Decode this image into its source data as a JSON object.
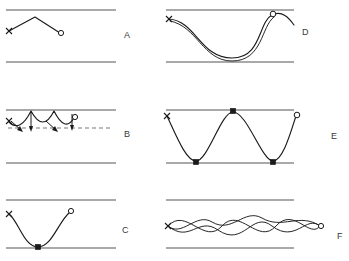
{
  "figure": {
    "title": "",
    "width": 349,
    "height": 261,
    "background_color": "#ffffff",
    "line_color": "#1a1a1a",
    "boundary_color": "#555555",
    "label_color": "#3a3a3a"
  },
  "panels": [
    {
      "id": "A",
      "label": "A",
      "label_x": 124,
      "label_y": 38,
      "description": "triangular peak trajectory between two horizontal walls",
      "top_wall_y": 10,
      "bottom_wall_y": 62,
      "wall_x1": 6,
      "wall_x2": 116,
      "start_marker": "x",
      "end_marker": "circle",
      "start_point": [
        9,
        31
      ],
      "end_point": [
        60,
        33
      ],
      "apex_point": [
        35,
        17
      ],
      "path": "M 9 31 L 35 17 L 60 33",
      "markers": []
    },
    {
      "id": "B",
      "label": "B",
      "label_x": 124,
      "label_y": 137,
      "description": "scalloped arcs hanging below upper wall with downward arrows and a dashed reference line",
      "top_wall_y": 110,
      "bottom_wall_y": 163,
      "wall_x1": 6,
      "wall_x2": 116,
      "dashed_line_y": 128,
      "dashed_x1": 8,
      "dashed_x2": 112,
      "start_marker": "x",
      "end_marker": "circle",
      "start_point": [
        9,
        122
      ],
      "end_point": [
        74,
        118
      ],
      "arc_count": 3,
      "path": "M 9 122 Q 20 133 31 111 Q 43 133 54 111 Q 65 133 74 118",
      "arrows": [
        {
          "x1": 11,
          "y1": 122,
          "x2": 24,
          "y2": 133,
          "direction": "down-right"
        },
        {
          "x1": 31,
          "y1": 113,
          "x2": 31,
          "y2": 131,
          "direction": "down"
        },
        {
          "x1": 46,
          "y1": 120,
          "x2": 58,
          "y2": 132,
          "direction": "down-right"
        },
        {
          "x1": 72,
          "y1": 114,
          "x2": 72,
          "y2": 130,
          "direction": "down"
        }
      ]
    },
    {
      "id": "C",
      "label": "C",
      "label_x": 122,
      "label_y": 233,
      "description": "smooth U-shaped curve descending to touch the lower wall then rising",
      "top_wall_y": 200,
      "bottom_wall_y": 248,
      "wall_x1": 6,
      "wall_x2": 116,
      "start_marker": "x",
      "end_marker": "circle",
      "start_point": [
        9,
        214
      ],
      "end_point": [
        70,
        212
      ],
      "contact_point": [
        38,
        247
      ],
      "contact_marker": "square",
      "path": "M 9 214 C 19 222 24 247 38 247 C 52 247 58 222 70 212"
    },
    {
      "id": "D",
      "label": "D",
      "label_x": 302,
      "label_y": 35,
      "description": "two near-parallel deep U-shaped curves with overshoot past the end marker",
      "top_wall_y": 10,
      "bottom_wall_y": 62,
      "wall_x1": 166,
      "wall_x2": 294,
      "start_marker": "x",
      "end_marker": "circle",
      "start_point": [
        169,
        19
      ],
      "end_point": [
        272,
        15
      ],
      "curve_count": 2,
      "path_main": "M 169 19 C 196 21 200 58 232 58 C 262 58 258 22 272 15 C 282 10 288 18 294 25",
      "path_secondary": "M 170 21 C 197 25 202 61 232 61 C 263 61 261 25 274 17",
      "overshoot": true
    },
    {
      "id": "E",
      "label": "E",
      "label_x": 331,
      "label_y": 139,
      "description": "oscillating wave bouncing between both walls with contact markers at extremes",
      "top_wall_y": 110,
      "bottom_wall_y": 163,
      "wall_x1": 166,
      "wall_x2": 294,
      "start_marker": "x",
      "end_marker": "circle",
      "start_point": [
        167,
        116
      ],
      "end_point": [
        296,
        116
      ],
      "contact_marker": "square",
      "contacts": [
        [
          196,
          162
        ],
        [
          233,
          111
        ],
        [
          273,
          162
        ]
      ],
      "path": "M 167 116 C 176 135 186 162 196 162 C 208 162 221 111 233 111 C 247 111 262 162 273 162 C 283 162 291 131 296 116"
    },
    {
      "id": "F",
      "label": "F",
      "label_x": 337,
      "label_y": 239,
      "description": "three superimposed wavy curves of differing frequency and amplitude",
      "top_wall_y": 200,
      "bottom_wall_y": 248,
      "wall_x1": 166,
      "wall_x2": 294,
      "start_marker": "x",
      "end_marker": "circle",
      "start_point": [
        168,
        226
      ],
      "end_point": [
        320,
        226
      ],
      "wave_count": 3,
      "path_wave1": "M 168 226 C 186 206 204 246 222 226 C 240 206 258 246 276 226 C 294 206 310 240 320 226",
      "path_wave2": "M 168 226 C 182 238 196 212 212 222 C 232 234 244 208 262 218 C 282 230 300 212 320 226",
      "path_wave3": "M 168 226 C 190 244 198 216 218 230 C 244 248 252 210 272 226 C 296 244 306 214 320 226"
    }
  ],
  "markers": {
    "start_symbol": "x",
    "end_symbol": "circle",
    "contact_symbol": "filled-square"
  }
}
